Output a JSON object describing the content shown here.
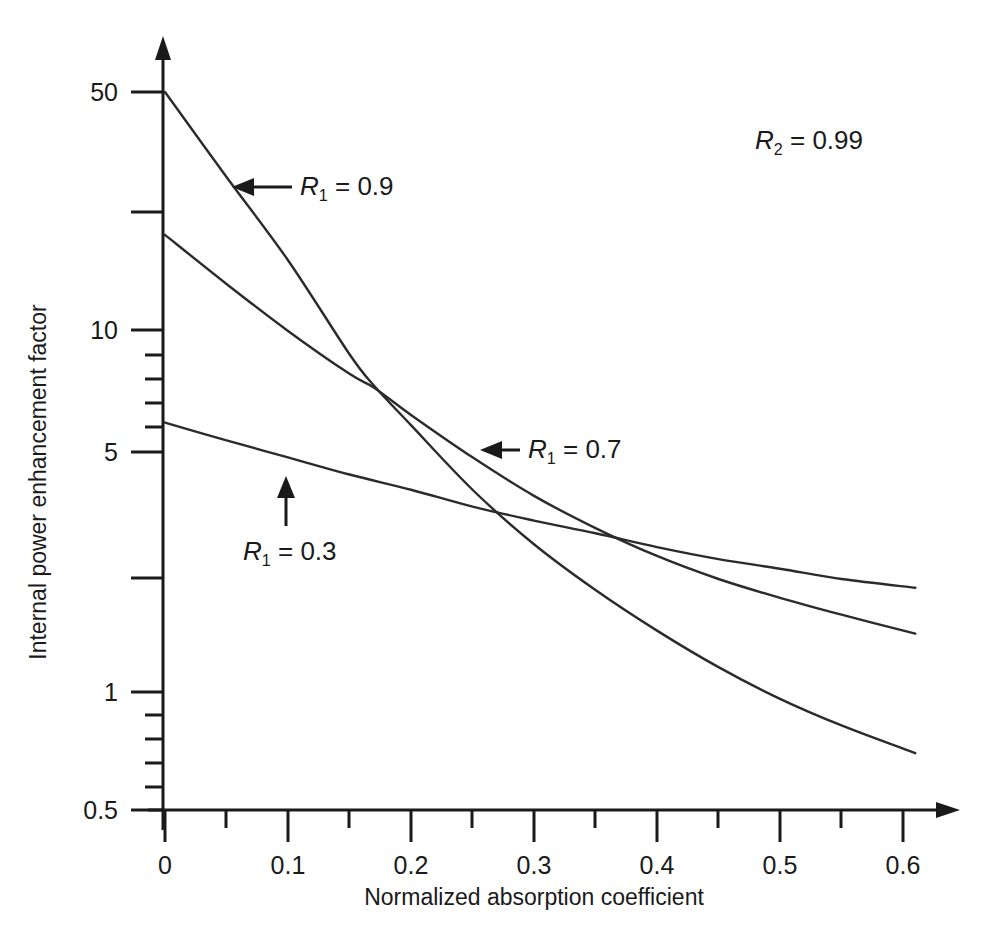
{
  "figure": {
    "background": "#ffffff",
    "line_color": "#2b2b2b",
    "axis_color": "#1a1a1a"
  },
  "axes": {
    "x": {
      "title": "Normalized absorption coefficient",
      "tick_labels": [
        "0",
        "0.1",
        "0.2",
        "0.3",
        "0.4",
        "0.5",
        "0.6"
      ],
      "tick_values": [
        0,
        0.1,
        0.2,
        0.3,
        0.4,
        0.5,
        0.6
      ],
      "minor_tick_values": [
        0.05,
        0.15,
        0.25,
        0.35,
        0.45,
        0.55
      ],
      "range": [
        0,
        0.62
      ]
    },
    "y": {
      "title": "Internal power enhancement factor",
      "scale": "log",
      "tick_labels": [
        "50",
        "10",
        "5",
        "1",
        "0.5"
      ],
      "labeled_tick_values": [
        50,
        10,
        5,
        1,
        0.5
      ],
      "unlabeled_major_tick_values": [
        20,
        2
      ],
      "minor_tick_values": [
        9,
        8,
        7,
        6,
        0.9,
        0.8,
        0.7,
        0.6
      ],
      "range": [
        0.5,
        60
      ]
    }
  },
  "annotations": [
    {
      "name": "r2-label",
      "text_prefix": "R",
      "subscript": "2",
      "text_suffix": " = 0.99",
      "full_text": "R2 = 0.99"
    },
    {
      "name": "r1-09-label",
      "text_prefix": "R",
      "subscript": "1",
      "text_suffix": " = 0.9",
      "full_text": "R1 = 0.9",
      "arrow": "left"
    },
    {
      "name": "r1-07-label",
      "text_prefix": "R",
      "subscript": "1",
      "text_suffix": " = 0.7",
      "full_text": "R1 = 0.7",
      "arrow": "left"
    },
    {
      "name": "r1-03-label",
      "text_prefix": "R",
      "subscript": "1",
      "text_suffix": " = 0.3",
      "full_text": "R1 = 0.3",
      "arrow": "up"
    }
  ],
  "chart_data": {
    "type": "line",
    "title": "",
    "xlabel": "Normalized absorption coefficient",
    "ylabel": "Internal power enhancement factor",
    "xlim": [
      0,
      0.62
    ],
    "ylim": [
      0.5,
      60
    ],
    "yscale": "log",
    "grid": false,
    "legend": "inline annotations",
    "annotation_text": "R2 = 0.99",
    "series": [
      {
        "name": "R1 = 0.9",
        "label": "R1 = 0.9",
        "x": [
          0.0,
          0.05,
          0.1,
          0.15,
          0.17,
          0.2,
          0.25,
          0.3,
          0.35,
          0.4,
          0.45,
          0.5,
          0.55,
          0.61
        ],
        "y": [
          50.0,
          29.0,
          17.0,
          9.3,
          7.6,
          5.9,
          3.9,
          2.75,
          2.05,
          1.58,
          1.25,
          1.02,
          0.86,
          0.72
        ]
      },
      {
        "name": "R1 = 0.7",
        "label": "R1 = 0.7",
        "x": [
          0.0,
          0.05,
          0.1,
          0.15,
          0.17,
          0.2,
          0.25,
          0.3,
          0.35,
          0.4,
          0.45,
          0.5,
          0.55,
          0.61
        ],
        "y": [
          20.0,
          14.6,
          10.8,
          8.2,
          7.5,
          6.3,
          4.8,
          3.75,
          3.05,
          2.55,
          2.2,
          1.95,
          1.75,
          1.55
        ]
      },
      {
        "name": "R1 = 0.3",
        "label": "R1 = 0.3",
        "x": [
          0.0,
          0.05,
          0.1,
          0.15,
          0.2,
          0.25,
          0.3,
          0.35,
          0.4,
          0.45,
          0.5,
          0.55,
          0.61
        ],
        "y": [
          6.0,
          5.35,
          4.8,
          4.3,
          3.9,
          3.5,
          3.2,
          2.95,
          2.7,
          2.5,
          2.35,
          2.2,
          2.08
        ]
      }
    ],
    "crossings": [
      {
        "series": [
          "R1 = 0.9",
          "R1 = 0.7"
        ],
        "x": 0.175,
        "y": 7.2
      },
      {
        "series": [
          "R1 = 0.9",
          "R1 = 0.3"
        ],
        "x": 0.295,
        "y": 3.0
      },
      {
        "series": [
          "R1 = 0.7",
          "R1 = 0.3"
        ],
        "x": 0.475,
        "y": 2.35
      }
    ]
  }
}
